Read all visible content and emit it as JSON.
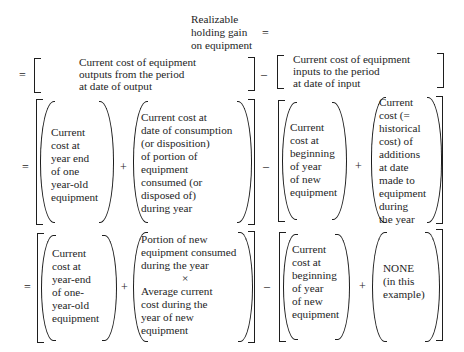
{
  "title": {
    "lines": [
      "Realizable",
      "holding gain",
      "on equipment"
    ],
    "equals": "="
  },
  "row1": {
    "equals": "=",
    "left_bracket": {
      "lines": [
        "Current cost of equipment",
        "outputs from the period",
        "at date of output"
      ]
    },
    "minus": "–",
    "right_bracket": {
      "lines": [
        "Current cost of equipment",
        "inputs to the period",
        "at date of input"
      ]
    }
  },
  "row2": {
    "equals": "=",
    "term1": [
      "Current",
      "cost at",
      "year end",
      "of one",
      "year-old",
      "equipment"
    ],
    "plus1": "+",
    "term2": [
      "Current cost at",
      "date of consumption",
      "(or disposition)",
      "of portion of",
      "equipment",
      "consumed (or",
      "disposed of)",
      "during year"
    ],
    "minus": "–",
    "term3": [
      "Current",
      "cost at",
      "beginning",
      "of year",
      "of new",
      "equipment"
    ],
    "plus2": "+",
    "term4": [
      "Current",
      "cost (=",
      "historical",
      "cost) of",
      "additions",
      "at date",
      "made to",
      "equipment",
      "during",
      "the year"
    ]
  },
  "row3": {
    "equals": "=",
    "term1": [
      "Current",
      "cost at",
      "year-end",
      "of one-",
      "year-old",
      "equipment"
    ],
    "plus1": "+",
    "term2_top": [
      "Portion of new",
      "equipment consumed",
      "during the year"
    ],
    "times": "×",
    "term2_bottom": [
      "Average current",
      "cost during the",
      "year of new",
      "equipment"
    ],
    "minus": "–",
    "term3": [
      "Current",
      "cost at",
      "beginning",
      "of year",
      "of new",
      "equipment"
    ],
    "plus2": "+",
    "term4": [
      "NONE",
      "(in this",
      "example)"
    ]
  }
}
